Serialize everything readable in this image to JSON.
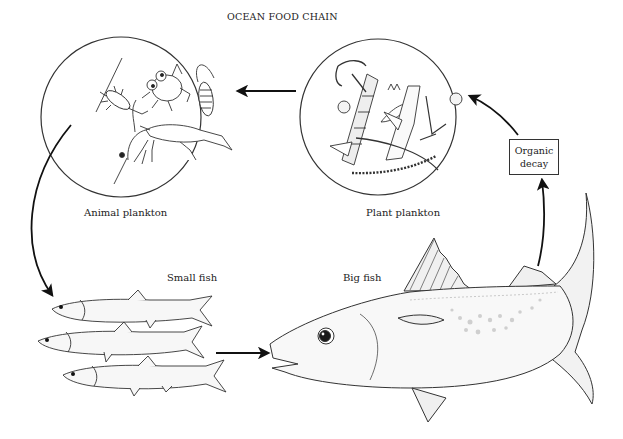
{
  "title": "OCEAN FOOD CHAIN",
  "nodes": {
    "animal_plankton": {
      "label": "Animal plankton"
    },
    "plant_plankton": {
      "label": "Plant plankton"
    },
    "small_fish": {
      "label": "Small fish"
    },
    "big_fish": {
      "label": "Big fish"
    },
    "organic_decay": {
      "line1": "Organic",
      "line2": "decay"
    }
  },
  "flows": [
    {
      "from": "Plant plankton",
      "to": "Animal plankton"
    },
    {
      "from": "Animal plankton",
      "to": "Small fish"
    },
    {
      "from": "Small fish",
      "to": "Big fish"
    },
    {
      "from": "Big fish",
      "to": "Organic decay"
    },
    {
      "from": "Organic decay",
      "to": "Plant plankton"
    }
  ],
  "colors": {
    "ink": "#222222",
    "background": "#ffffff",
    "shade": "#cfcfcf"
  }
}
